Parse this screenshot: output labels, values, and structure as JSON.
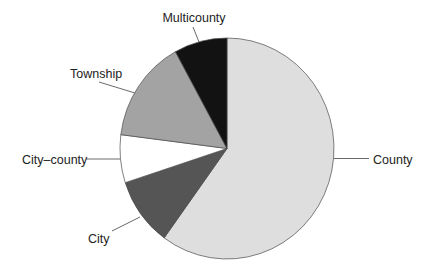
{
  "chart_data": {
    "type": "pie",
    "title": "",
    "categories": [
      "County",
      "City",
      "City–county",
      "Township",
      "Multicounty"
    ],
    "values": [
      60,
      10,
      7,
      15,
      8
    ],
    "unit": "percent (estimated from slice angles)",
    "start_angle": "12 o'clock, clockwise",
    "colors": [
      "#dedede",
      "#555555",
      "#ffffff",
      "#a3a3a3",
      "#121212"
    ],
    "legend": "none (direct labels with leader lines)"
  },
  "labels": {
    "county": "County",
    "city": "City",
    "city_county": "City–county",
    "township": "Township",
    "multicounty": "Multicounty"
  }
}
